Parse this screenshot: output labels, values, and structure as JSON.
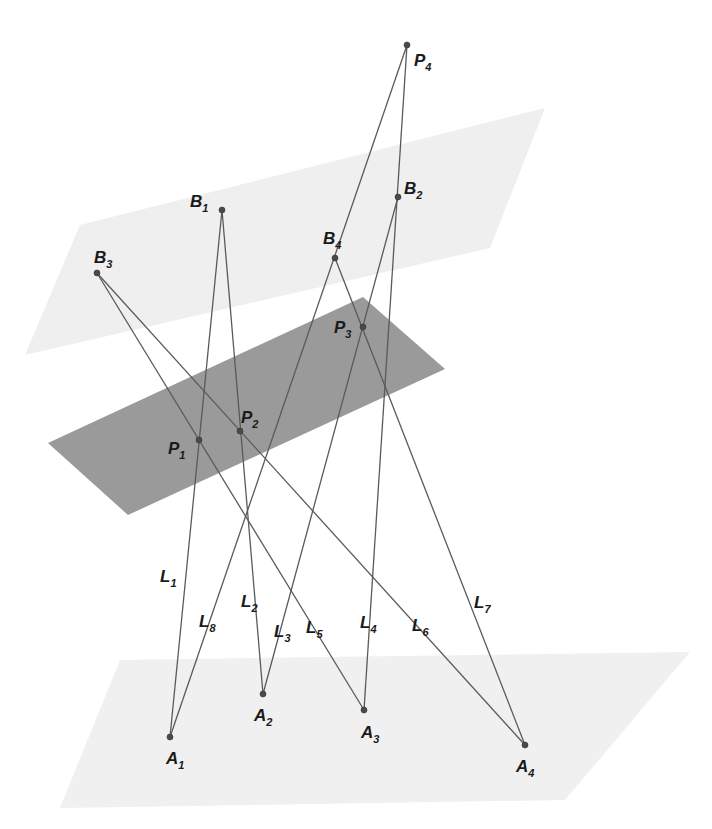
{
  "figure": {
    "width": 712,
    "height": 829,
    "background": "#ffffff",
    "line_color": "#5a5a5a",
    "point_color": "#4a4a4a",
    "label_color": "#1a1a1a"
  },
  "planes": [
    {
      "id": "upper-plane",
      "fill": "#e9e9e9",
      "opacity": 0.75,
      "corners": [
        [
          80,
          225
        ],
        [
          545,
          108
        ],
        [
          490,
          248
        ],
        [
          25,
          355
        ]
      ]
    },
    {
      "id": "middle-plane",
      "fill": "#9a9a9a",
      "opacity": 1,
      "corners": [
        [
          48,
          443
        ],
        [
          363,
          297
        ],
        [
          445,
          369
        ],
        [
          128,
          515
        ]
      ]
    },
    {
      "id": "lower-plane",
      "fill": "#ececec",
      "opacity": 0.8,
      "corners": [
        [
          120,
          660
        ],
        [
          690,
          652
        ],
        [
          565,
          800
        ],
        [
          60,
          808
        ]
      ]
    }
  ],
  "points": [
    {
      "name": "P",
      "sub": "4",
      "x": 407,
      "y": 45,
      "lx": 414,
      "ly": 66
    },
    {
      "name": "B",
      "sub": "1",
      "x": 222,
      "y": 210,
      "lx": 190,
      "ly": 207
    },
    {
      "name": "B",
      "sub": "2",
      "x": 398,
      "y": 197,
      "lx": 404,
      "ly": 194
    },
    {
      "name": "B",
      "sub": "3",
      "x": 97,
      "y": 273,
      "lx": 94,
      "ly": 263
    },
    {
      "name": "B",
      "sub": "4",
      "x": 335,
      "y": 258,
      "lx": 323,
      "ly": 244
    },
    {
      "name": "P",
      "sub": "3",
      "x": 363,
      "y": 327,
      "lx": 334,
      "ly": 333
    },
    {
      "name": "P",
      "sub": "1",
      "x": 199,
      "y": 440,
      "lx": 168,
      "ly": 454
    },
    {
      "name": "P",
      "sub": "2",
      "x": 240,
      "y": 431,
      "lx": 241,
      "ly": 423
    },
    {
      "name": "A",
      "sub": "1",
      "x": 170,
      "y": 737,
      "lx": 166,
      "ly": 764
    },
    {
      "name": "A",
      "sub": "2",
      "x": 263,
      "y": 694,
      "lx": 254,
      "ly": 721
    },
    {
      "name": "A",
      "sub": "3",
      "x": 364,
      "y": 710,
      "lx": 361,
      "ly": 738
    },
    {
      "name": "A",
      "sub": "4",
      "x": 525,
      "y": 745,
      "lx": 516,
      "ly": 772
    }
  ],
  "segments": [
    {
      "id": "L1",
      "from": [
        222,
        210
      ],
      "to": [
        170,
        737
      ]
    },
    {
      "id": "L2",
      "from": [
        222,
        210
      ],
      "to": [
        263,
        694
      ]
    },
    {
      "id": "L3",
      "from": [
        398,
        197
      ],
      "to": [
        263,
        694
      ]
    },
    {
      "id": "L4",
      "from": [
        407,
        45
      ],
      "to": [
        364,
        710
      ]
    },
    {
      "id": "L5",
      "from": [
        97,
        273
      ],
      "to": [
        364,
        710
      ]
    },
    {
      "id": "L6",
      "from": [
        97,
        273
      ],
      "to": [
        525,
        745
      ]
    },
    {
      "id": "L7",
      "from": [
        335,
        258
      ],
      "to": [
        525,
        745
      ]
    },
    {
      "id": "L8",
      "from": [
        407,
        45
      ],
      "to": [
        170,
        737
      ]
    }
  ],
  "line_labels": [
    {
      "name": "L",
      "sub": "1",
      "x": 160,
      "y": 582
    },
    {
      "name": "L",
      "sub": "2",
      "x": 241,
      "y": 607
    },
    {
      "name": "L",
      "sub": "3",
      "x": 274,
      "y": 637
    },
    {
      "name": "L",
      "sub": "4",
      "x": 360,
      "y": 628
    },
    {
      "name": "L",
      "sub": "5",
      "x": 306,
      "y": 633
    },
    {
      "name": "L",
      "sub": "6",
      "x": 412,
      "y": 631
    },
    {
      "name": "L",
      "sub": "7",
      "x": 474,
      "y": 608
    },
    {
      "name": "L",
      "sub": "8",
      "x": 199,
      "y": 627
    }
  ]
}
